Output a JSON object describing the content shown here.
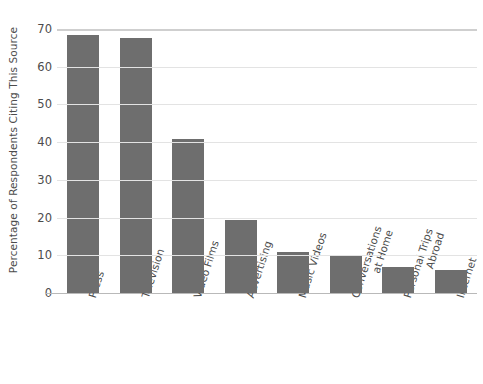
{
  "chart_data": {
    "type": "bar",
    "title": "",
    "xlabel": "",
    "ylabel": "Percentage of Respondents Citing This Source",
    "ylim": [
      0,
      70
    ],
    "yticks": [
      0,
      10,
      20,
      30,
      40,
      50,
      60,
      70
    ],
    "grid": true,
    "legend": null,
    "bar_color": "#6e6e6e",
    "gridline_color": "#e3e3e3",
    "axis_color": "#b9b9b9",
    "text_color": "#4c4c4c",
    "categories": [
      "Press",
      "Television",
      "Video Films",
      "Advertising",
      "Music Videos",
      "Conversations at Home",
      "Personal Trips Abroad",
      "Internet"
    ],
    "category_lines": [
      [
        "Press"
      ],
      [
        "Television"
      ],
      [
        "Video Films"
      ],
      [
        "Advertising"
      ],
      [
        "Music Videos"
      ],
      [
        "Conversations",
        "at Home"
      ],
      [
        "Personal Trips",
        "Abroad"
      ],
      [
        "Internet"
      ]
    ],
    "values": [
      68.5,
      67.5,
      40.8,
      19.4,
      11,
      10,
      7,
      6
    ]
  }
}
